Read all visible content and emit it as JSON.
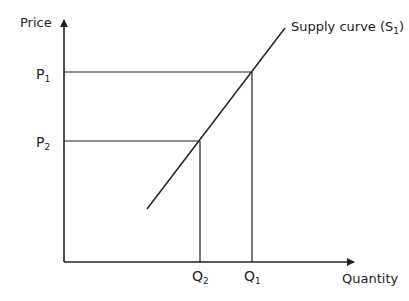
{
  "diagram": {
    "y_axis_label": "Price",
    "x_axis_label": "Quantity",
    "curve_label": "Supply curve (S",
    "curve_label_sub": "1",
    "curve_label_close": ")",
    "price_levels": [
      {
        "letter": "P",
        "sub": "1"
      },
      {
        "letter": "P",
        "sub": "2"
      }
    ],
    "quantity_levels": [
      {
        "letter": "Q",
        "sub": "2"
      },
      {
        "letter": "Q",
        "sub": "1"
      }
    ],
    "line_color": "#222222"
  }
}
